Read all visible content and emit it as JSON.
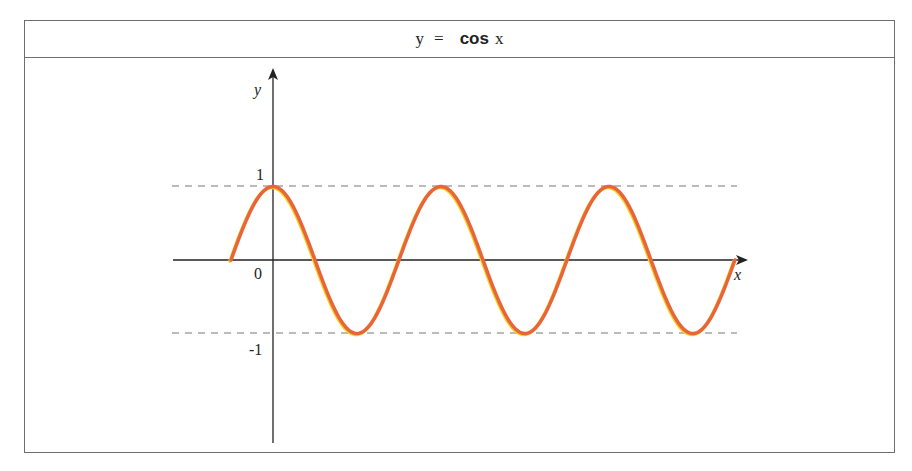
{
  "title": {
    "y": "y",
    "equals": "=",
    "fn": "cos",
    "x": "x"
  },
  "axes": {
    "x_label": "x",
    "y_label": "y",
    "origin_label": "0",
    "tick_labels": {
      "one": "1",
      "minus_one": "-1"
    }
  },
  "colors": {
    "curve": "#e8643a",
    "curve_highlight": "#f5d020",
    "axis": "#222222",
    "dashed": "#777777",
    "border": "#6e6e6e"
  },
  "chart_data": {
    "type": "line",
    "title": "y = cos x",
    "xlabel": "x",
    "ylabel": "y",
    "function": "cos(x)",
    "x_range": [
      -1.5708,
      17.2788
    ],
    "ylim": [
      -1,
      1
    ],
    "y_ticks": [
      1,
      0,
      -1
    ],
    "reference_lines": [
      {
        "y": 1,
        "style": "dashed"
      },
      {
        "y": -1,
        "style": "dashed"
      }
    ],
    "key_points": [
      {
        "x": -1.5708,
        "y": 0
      },
      {
        "x": 0,
        "y": 1
      },
      {
        "x": 3.1416,
        "y": -1
      },
      {
        "x": 6.2832,
        "y": 1
      },
      {
        "x": 9.4248,
        "y": -1
      },
      {
        "x": 12.5664,
        "y": 1
      },
      {
        "x": 15.708,
        "y": -1
      },
      {
        "x": 17.2788,
        "y": 0
      }
    ],
    "grid": false,
    "legend": null
  }
}
